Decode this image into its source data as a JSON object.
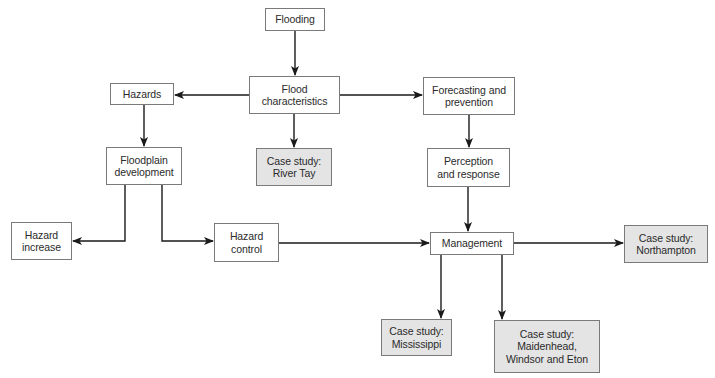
{
  "diagram": {
    "colors": {
      "box_border": "#7a7a7a",
      "box_fill": "#ffffff",
      "case_study_fill": "#e4e4e4",
      "line": "#1a1a1a",
      "text": "#2b2b2b"
    },
    "nodes": {
      "flooding": {
        "label": "Flooding",
        "type": "concept"
      },
      "flood_characteristics": {
        "label": "Flood\ncharacteristics",
        "type": "concept"
      },
      "hazards": {
        "label": "Hazards",
        "type": "concept"
      },
      "forecasting": {
        "label": "Forecasting and\nprevention",
        "type": "concept"
      },
      "floodplain": {
        "label": "Floodplain\ndevelopment",
        "type": "concept"
      },
      "river_tay": {
        "label": "Case study:\nRiver Tay",
        "type": "case-study"
      },
      "perception": {
        "label": "Perception\nand response",
        "type": "concept"
      },
      "hazard_increase": {
        "label": "Hazard\nincrease",
        "type": "concept"
      },
      "hazard_control": {
        "label": "Hazard\ncontrol",
        "type": "concept"
      },
      "management": {
        "label": "Management",
        "type": "concept"
      },
      "northampton": {
        "label": "Case study:\nNorthampton",
        "type": "case-study"
      },
      "mississippi": {
        "label": "Case study:\nMississippi",
        "type": "case-study"
      },
      "maidenhead": {
        "label": "Case study:\nMaidenhead,\nWindsor and Eton",
        "type": "case-study"
      }
    },
    "edges": [
      {
        "from": "Flooding",
        "to": "Flood characteristics"
      },
      {
        "from": "Flood characteristics",
        "to": "Hazards"
      },
      {
        "from": "Flood characteristics",
        "to": "Forecasting and prevention"
      },
      {
        "from": "Flood characteristics",
        "to": "Case study: River Tay"
      },
      {
        "from": "Hazards",
        "to": "Floodplain development"
      },
      {
        "from": "Forecasting and prevention",
        "to": "Perception and response"
      },
      {
        "from": "Floodplain development",
        "to": "Hazard increase"
      },
      {
        "from": "Floodplain development",
        "to": "Hazard control"
      },
      {
        "from": "Perception and response",
        "to": "Management"
      },
      {
        "from": "Hazard control",
        "to": "Management"
      },
      {
        "from": "Management",
        "to": "Case study: Northampton"
      },
      {
        "from": "Management",
        "to": "Case study: Mississippi"
      },
      {
        "from": "Management",
        "to": "Case study: Maidenhead, Windsor and Eton"
      }
    ]
  }
}
